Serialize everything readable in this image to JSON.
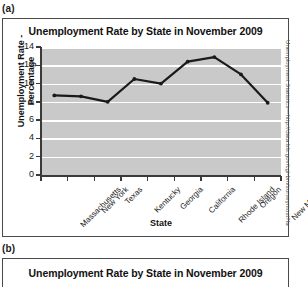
{
  "panels": {
    "a_label": "(a)",
    "b_label": "(b)"
  },
  "source_credit": "Unemployment Statistics—http://data.bls.gov/cgi-bin/surveymost?la",
  "chart_data": {
    "type": "line",
    "title": "Unemployment Rate by State in November 2009",
    "xlabel": "State",
    "ylabel": "Unemployment Rate - Percentage",
    "categories": [
      "Massachusetts",
      "New York",
      "Texas",
      "Kentucky",
      "Georgia",
      "California",
      "Rhode Island",
      "Oregon",
      "New Mexico"
    ],
    "values": [
      8.7,
      8.6,
      8.0,
      10.5,
      10.0,
      12.4,
      12.9,
      11.0,
      7.9
    ],
    "ylim": [
      0,
      14
    ],
    "yticks": [
      0,
      2,
      4,
      6,
      8,
      10,
      12,
      14
    ],
    "ytick_labels": [
      "0",
      "2",
      "4",
      "6",
      "8",
      "10",
      "12",
      "14"
    ],
    "grid": "horizontal-white",
    "legend": "none",
    "plot_background": "#c9c9c9",
    "series_color": "#1a1a1a",
    "marker": "dot"
  },
  "chart_b": {
    "title": "Unemployment Rate by State in November 2009"
  }
}
